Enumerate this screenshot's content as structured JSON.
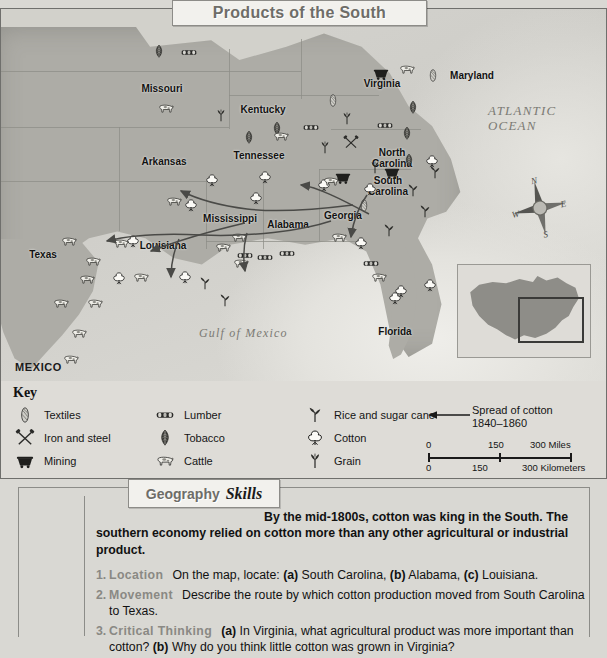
{
  "title": "Products of the South",
  "map": {
    "ocean_labels": [
      {
        "text": "ATLANTIC\nOCEAN",
        "x": 487,
        "y": 95,
        "size": 13
      },
      {
        "text": "Gulf of Mexico",
        "x": 198,
        "y": 318,
        "size": 12
      }
    ],
    "countries": [
      {
        "text": "MEXICO",
        "x": 14,
        "y": 352
      }
    ],
    "states": [
      {
        "name": "Missouri",
        "x": 161,
        "y": 75
      },
      {
        "name": "Kentucky",
        "x": 262,
        "y": 96
      },
      {
        "name": "Virginia",
        "x": 381,
        "y": 70
      },
      {
        "name": "Maryland",
        "x": 471,
        "y": 62
      },
      {
        "name": "Arkansas",
        "x": 163,
        "y": 148
      },
      {
        "name": "Tennessee",
        "x": 258,
        "y": 142
      },
      {
        "name": "North\nCarolina",
        "x": 391,
        "y": 139
      },
      {
        "name": "South\nCarolina",
        "x": 387,
        "y": 167
      },
      {
        "name": "Mississippi",
        "x": 229,
        "y": 205
      },
      {
        "name": "Alabama",
        "x": 287,
        "y": 211
      },
      {
        "name": "Georgia",
        "x": 342,
        "y": 202
      },
      {
        "name": "Louisiana",
        "x": 162,
        "y": 232
      },
      {
        "name": "Texas",
        "x": 42,
        "y": 241
      },
      {
        "name": "Florida",
        "x": 394,
        "y": 318
      }
    ],
    "product_icons": [
      {
        "type": "tobacco",
        "x": 150,
        "y": 36
      },
      {
        "type": "lumber",
        "x": 180,
        "y": 37
      },
      {
        "type": "cattle",
        "x": 157,
        "y": 93
      },
      {
        "type": "grain",
        "x": 212,
        "y": 100
      },
      {
        "type": "tobacco",
        "x": 268,
        "y": 113
      },
      {
        "type": "lumber",
        "x": 302,
        "y": 112
      },
      {
        "type": "textiles",
        "x": 324,
        "y": 85
      },
      {
        "type": "grain",
        "x": 338,
        "y": 103
      },
      {
        "type": "mining",
        "x": 372,
        "y": 58
      },
      {
        "type": "cattle",
        "x": 398,
        "y": 54
      },
      {
        "type": "textiles",
        "x": 424,
        "y": 60
      },
      {
        "type": "iron",
        "x": 342,
        "y": 127
      },
      {
        "type": "tobacco",
        "x": 240,
        "y": 122
      },
      {
        "type": "cattle",
        "x": 272,
        "y": 121
      },
      {
        "type": "grain",
        "x": 316,
        "y": 132
      },
      {
        "type": "tobacco",
        "x": 404,
        "y": 92
      },
      {
        "type": "lumber",
        "x": 376,
        "y": 110
      },
      {
        "type": "tobacco",
        "x": 398,
        "y": 118
      },
      {
        "type": "tobacco",
        "x": 400,
        "y": 145
      },
      {
        "type": "cotton",
        "x": 423,
        "y": 146
      },
      {
        "type": "grain",
        "x": 366,
        "y": 152
      },
      {
        "type": "mining",
        "x": 383,
        "y": 157
      },
      {
        "type": "cotton",
        "x": 361,
        "y": 174
      },
      {
        "type": "rice",
        "x": 404,
        "y": 175
      },
      {
        "type": "rice",
        "x": 426,
        "y": 157
      },
      {
        "type": "rice",
        "x": 416,
        "y": 196
      },
      {
        "type": "cotton",
        "x": 203,
        "y": 165
      },
      {
        "type": "cotton",
        "x": 256,
        "y": 162
      },
      {
        "type": "cotton",
        "x": 182,
        "y": 190
      },
      {
        "type": "cotton",
        "x": 315,
        "y": 170
      },
      {
        "type": "cattle",
        "x": 322,
        "y": 166
      },
      {
        "type": "mining",
        "x": 334,
        "y": 162
      },
      {
        "type": "textiles",
        "x": 355,
        "y": 190
      },
      {
        "type": "cotton",
        "x": 247,
        "y": 183
      },
      {
        "type": "cattle",
        "x": 165,
        "y": 186
      },
      {
        "type": "cattle",
        "x": 230,
        "y": 222
      },
      {
        "type": "cattle",
        "x": 330,
        "y": 222
      },
      {
        "type": "lumber",
        "x": 236,
        "y": 240
      },
      {
        "type": "lumber",
        "x": 278,
        "y": 238
      },
      {
        "type": "lumber",
        "x": 362,
        "y": 248
      },
      {
        "type": "cotton",
        "x": 352,
        "y": 228
      },
      {
        "type": "rice",
        "x": 380,
        "y": 215
      },
      {
        "type": "cattle",
        "x": 370,
        "y": 262
      },
      {
        "type": "cotton",
        "x": 392,
        "y": 276
      },
      {
        "type": "cattle",
        "x": 232,
        "y": 248
      },
      {
        "type": "lumber",
        "x": 256,
        "y": 242
      },
      {
        "type": "cotton",
        "x": 176,
        "y": 262
      },
      {
        "type": "rice",
        "x": 196,
        "y": 268
      },
      {
        "type": "rice",
        "x": 216,
        "y": 285
      },
      {
        "type": "cotton",
        "x": 124,
        "y": 226
      },
      {
        "type": "cattle",
        "x": 60,
        "y": 226
      },
      {
        "type": "cattle",
        "x": 112,
        "y": 228
      },
      {
        "type": "cattle",
        "x": 84,
        "y": 246
      },
      {
        "type": "cattle",
        "x": 214,
        "y": 232
      },
      {
        "type": "cattle",
        "x": 78,
        "y": 264
      },
      {
        "type": "cotton",
        "x": 110,
        "y": 263
      },
      {
        "type": "cattle",
        "x": 132,
        "y": 262
      },
      {
        "type": "cattle",
        "x": 52,
        "y": 288
      },
      {
        "type": "cattle",
        "x": 86,
        "y": 288
      },
      {
        "type": "cattle",
        "x": 70,
        "y": 318
      },
      {
        "type": "cattle",
        "x": 62,
        "y": 344
      },
      {
        "type": "cotton",
        "x": 386,
        "y": 283
      },
      {
        "type": "cotton",
        "x": 421,
        "y": 270
      }
    ]
  },
  "key": {
    "title": "Key",
    "columns": [
      [
        {
          "icon": "textiles-icon",
          "label": "Textiles"
        },
        {
          "icon": "iron-icon",
          "label": "Iron and steel"
        },
        {
          "icon": "mining-icon",
          "label": "Mining"
        }
      ],
      [
        {
          "icon": "lumber-icon",
          "label": "Lumber"
        },
        {
          "icon": "tobacco-icon",
          "label": "Tobacco"
        },
        {
          "icon": "cattle-icon",
          "label": "Cattle"
        }
      ],
      [
        {
          "icon": "rice-icon",
          "label": "Rice and sugar cane"
        },
        {
          "icon": "cotton-icon",
          "label": "Cotton"
        },
        {
          "icon": "grain-icon",
          "label": "Grain"
        }
      ]
    ],
    "spread": {
      "line1": "Spread of cotton",
      "line2": "1840–1860"
    },
    "scale": {
      "miles": {
        "ticks": [
          "0",
          "150",
          "300 Miles"
        ]
      },
      "kilometers": {
        "ticks": [
          "0",
          "150",
          "300 Kilometers"
        ]
      }
    }
  },
  "skills": {
    "banner_word1": "Geography",
    "banner_word2": "Skills",
    "intro": "By the mid-1800s, cotton was king in the South. The southern economy relied on cotton more than any other agricultural or industrial product.",
    "questions": [
      {
        "num": "1.",
        "category": "Location",
        "parts": [
          {
            "t": "On the map, locate: ",
            "b": false
          },
          {
            "t": "(a)",
            "b": true
          },
          {
            "t": " South Carolina, ",
            "b": false
          },
          {
            "t": "(b)",
            "b": true
          },
          {
            "t": " Alabama, ",
            "b": false
          },
          {
            "t": "(c)",
            "b": true
          },
          {
            "t": " Louisiana.",
            "b": false
          }
        ]
      },
      {
        "num": "2.",
        "category": "Movement",
        "parts": [
          {
            "t": "Describe the route by which cotton production moved from South Carolina to Texas.",
            "b": false
          }
        ]
      },
      {
        "num": "3.",
        "category": "Critical Thinking",
        "parts": [
          {
            "t": "(a)",
            "b": true
          },
          {
            "t": " In Virginia, what agricultural product was more important than cotton? ",
            "b": false
          },
          {
            "t": "(b)",
            "b": true
          },
          {
            "t": " Why do you think little cotton was grown in Virginia?",
            "b": false
          }
        ]
      }
    ]
  }
}
